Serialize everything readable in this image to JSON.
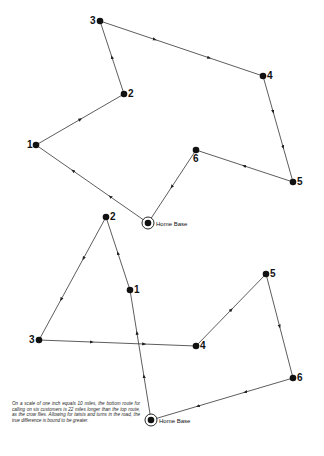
{
  "diagram": {
    "type": "route-comparison",
    "line_color": "#333333",
    "node_color": "#111111",
    "routes": [
      {
        "name": "top-route",
        "home_label": "Home Base",
        "home": {
          "x": 148,
          "y": 223
        },
        "stops": [
          {
            "label": "1",
            "x": 36,
            "y": 145,
            "label_dx": -9,
            "label_dy": 3
          },
          {
            "label": "2",
            "x": 124,
            "y": 94,
            "label_dx": 4,
            "label_dy": 3
          },
          {
            "label": "3",
            "x": 100,
            "y": 21,
            "label_dx": -10,
            "label_dy": 3
          },
          {
            "label": "4",
            "x": 263,
            "y": 76,
            "label_dx": 4,
            "label_dy": 3
          },
          {
            "label": "5",
            "x": 293,
            "y": 182,
            "label_dx": 4,
            "label_dy": 3
          },
          {
            "label": "6",
            "x": 196,
            "y": 150,
            "label_dx": -3,
            "label_dy": 12
          }
        ],
        "order": [
          "Home Base",
          "1",
          "2",
          "3",
          "4",
          "5",
          "6",
          "Home Base"
        ]
      },
      {
        "name": "bottom-route",
        "home_label": "Home Base",
        "home": {
          "x": 151,
          "y": 420
        },
        "stops": [
          {
            "label": "1",
            "x": 130,
            "y": 290,
            "label_dx": 4,
            "label_dy": 3
          },
          {
            "label": "2",
            "x": 106,
            "y": 217,
            "label_dx": 4,
            "label_dy": 3
          },
          {
            "label": "3",
            "x": 39,
            "y": 340,
            "label_dx": -10,
            "label_dy": 3
          },
          {
            "label": "4",
            "x": 196,
            "y": 346,
            "label_dx": 4,
            "label_dy": 3
          },
          {
            "label": "5",
            "x": 266,
            "y": 274,
            "label_dx": 4,
            "label_dy": 3
          },
          {
            "label": "6",
            "x": 293,
            "y": 378,
            "label_dx": 4,
            "label_dy": 3
          }
        ],
        "order": [
          "Home Base",
          "1",
          "2",
          "3",
          "4",
          "5",
          "6",
          "Home Base"
        ]
      }
    ],
    "caption": "On a scale of one inch equals 10 miles, the bottom route for calling on six customers is 22 miles longer than the top route, as the crow flies. Allowing for twists and turns in the road, the true difference is bound to be greater."
  }
}
